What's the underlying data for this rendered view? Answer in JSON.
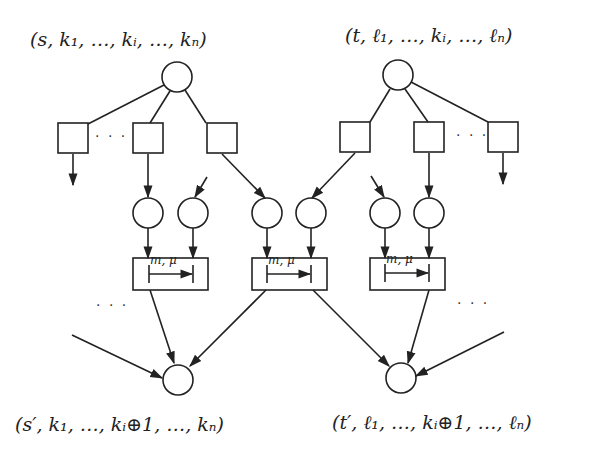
{
  "diagram": {
    "title_labels": {
      "top_left": "(s, k₁, …, kᵢ, …, kₙ)",
      "top_right": "(t, ℓ₁, …, kᵢ, …, ℓₙ)",
      "bottom_left": "(s′, k₁, …, kᵢ⊕1, …, kₙ)",
      "bottom_right": "(t′, ℓ₁, …, kᵢ⊕1, …, ℓₙ)"
    },
    "transition_boxes": [
      {
        "label": "m, μ"
      },
      {
        "label": "m, μ"
      },
      {
        "label": "m, μ"
      }
    ],
    "ellipses": {
      "top_left": "· · ·",
      "top_right": "· · ·",
      "mid_left": "· · ·",
      "mid_right": "· · ·"
    },
    "colors": {
      "stroke": "#222222",
      "background": "#ffffff"
    }
  }
}
